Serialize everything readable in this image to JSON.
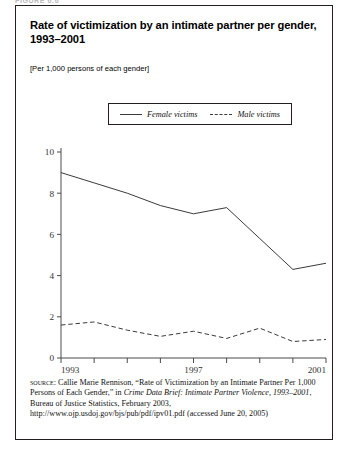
{
  "figure_label": "FIGURE 6.6",
  "title": "Rate of victimization by an intimate partner per gender, 1993–2001",
  "subtitle": "[Per 1,000 persons of each gender]",
  "legend": {
    "female_label": "Female victims",
    "male_label": "Male victims"
  },
  "source": {
    "keyword": "source:",
    "text_1": " Callie Marie Rennison, “Rate of Victimization by an Intimate Partner Per 1,000 Persons of Each Gender,” in ",
    "italic_1": "Crime Data Brief: Intimate Partner Violence, 1993–2001",
    "text_2": ", Bureau of Justice Statistics, February 2003, http://www.ojp.usdoj.gov/bjs/pub/pdf/ipv01.pdf (accessed June 20, 2005)"
  },
  "chart_data": {
    "type": "line",
    "title": "Rate of victimization by an intimate partner per gender, 1993–2001",
    "subtitle": "[Per 1,000 persons of each gender]",
    "xlabel": "",
    "ylabel": "",
    "x": [
      1993,
      1994,
      1995,
      1996,
      1997,
      1998,
      1999,
      2000,
      2001
    ],
    "xtick_labels": [
      "1993",
      "",
      "",
      "",
      "1997",
      "",
      "",
      "",
      "2001"
    ],
    "xlim": [
      1993,
      2001
    ],
    "ylim": [
      0,
      10
    ],
    "yticks": [
      0,
      2,
      4,
      6,
      8,
      10
    ],
    "ytick_labels": [
      "0",
      "2",
      "4",
      "6",
      "8",
      "10"
    ],
    "grid": false,
    "legend_position": "above-plot",
    "series": [
      {
        "name": "Female victims",
        "style": "solid",
        "color": "#3a3a3a",
        "values": [
          9.0,
          8.5,
          8.0,
          7.4,
          7.0,
          7.3,
          5.8,
          4.3,
          4.6
        ]
      },
      {
        "name": "Male victims",
        "style": "dashed",
        "color": "#3a3a3a",
        "values": [
          1.6,
          1.75,
          1.35,
          1.05,
          1.3,
          0.95,
          1.45,
          0.8,
          0.9
        ]
      }
    ]
  }
}
